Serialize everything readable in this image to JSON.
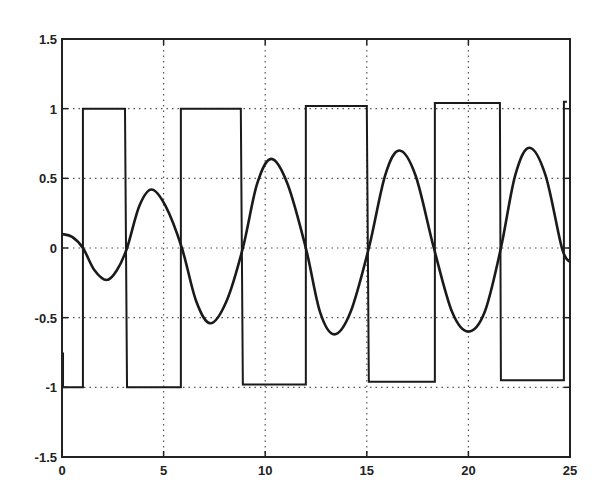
{
  "chart_data": {
    "type": "line",
    "title": "",
    "xlabel": "",
    "ylabel": "",
    "xlim": [
      0,
      25
    ],
    "ylim": [
      -1.5,
      1.5
    ],
    "grid": true,
    "legend": null,
    "xticks": [
      0,
      5,
      10,
      15,
      20,
      25
    ],
    "xtick_labels": [
      "0",
      "5",
      "10",
      "15",
      "20",
      "25"
    ],
    "yticks": [
      -1.5,
      -1,
      -0.5,
      0,
      0.5,
      1,
      1.5
    ],
    "ytick_labels": [
      "-1.5",
      "-1",
      "-0.5",
      "0",
      "0.5",
      "1",
      "1.5"
    ],
    "series": [
      {
        "name": "oscillatory response",
        "style": "smooth",
        "points": [
          [
            0,
            0.1
          ],
          [
            0.5,
            0.08
          ],
          [
            1.03,
            0.0
          ],
          [
            1.6,
            -0.16
          ],
          [
            2.2,
            -0.23
          ],
          [
            2.7,
            -0.16
          ],
          [
            3.2,
            0.0
          ],
          [
            3.8,
            0.3
          ],
          [
            4.4,
            0.42
          ],
          [
            5.1,
            0.3
          ],
          [
            5.9,
            0.0
          ],
          [
            6.6,
            -0.38
          ],
          [
            7.3,
            -0.54
          ],
          [
            8.1,
            -0.38
          ],
          [
            8.9,
            0.0
          ],
          [
            9.6,
            0.46
          ],
          [
            10.3,
            0.64
          ],
          [
            11.1,
            0.46
          ],
          [
            12.0,
            0.0
          ],
          [
            12.7,
            -0.46
          ],
          [
            13.4,
            -0.62
          ],
          [
            14.2,
            -0.46
          ],
          [
            15.1,
            0.0
          ],
          [
            15.9,
            0.52
          ],
          [
            16.6,
            0.7
          ],
          [
            17.4,
            0.52
          ],
          [
            18.3,
            0.0
          ],
          [
            19.2,
            -0.46
          ],
          [
            20.0,
            -0.6
          ],
          [
            20.8,
            -0.46
          ],
          [
            21.6,
            0.0
          ],
          [
            22.3,
            0.52
          ],
          [
            23.0,
            0.72
          ],
          [
            23.8,
            0.52
          ],
          [
            24.6,
            0.0
          ],
          [
            25.0,
            -0.1
          ]
        ]
      },
      {
        "name": "square wave",
        "style": "step",
        "points": [
          [
            0.05,
            -0.75
          ],
          [
            0.05,
            -1.0
          ],
          [
            1.03,
            -1.0
          ],
          [
            1.03,
            1.0
          ],
          [
            3.1,
            1.0
          ],
          [
            3.2,
            -1.0
          ],
          [
            5.85,
            -1.0
          ],
          [
            5.85,
            1.0
          ],
          [
            8.8,
            1.0
          ],
          [
            8.9,
            -0.98
          ],
          [
            12.0,
            -0.98
          ],
          [
            12.0,
            1.02
          ],
          [
            15.0,
            1.02
          ],
          [
            15.1,
            -0.96
          ],
          [
            18.35,
            -0.96
          ],
          [
            18.35,
            1.04
          ],
          [
            21.55,
            1.04
          ],
          [
            21.6,
            -0.95
          ],
          [
            24.7,
            -0.95
          ],
          [
            24.7,
            1.05
          ],
          [
            24.85,
            1.05
          ]
        ]
      }
    ]
  }
}
